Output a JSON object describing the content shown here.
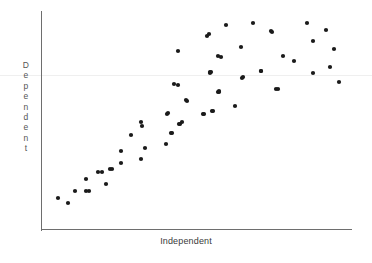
{
  "chart_data": {
    "type": "scatter",
    "title": "",
    "subtitle": "",
    "xlabel": "Independent",
    "ylabel": "Dependent",
    "ylabel_letters": [
      "D",
      "e",
      "p",
      "e",
      "n",
      "d",
      "e",
      "n",
      "t"
    ],
    "xlabel_tick_labels": [],
    "ylabel_tick_labels": [],
    "grid": false,
    "legend": null,
    "legend_position": "none",
    "marker": "filled-circle",
    "marker_color": "#1a1a1a",
    "marker_radius_px": 2.1,
    "axis_color": "#6e6e6e",
    "background_color": "#ffffff",
    "annotations": [],
    "xlim": [
      0,
      1
    ],
    "ylim": [
      0,
      1
    ],
    "axes_pixel_box": {
      "left": 41,
      "right": 352,
      "top": 11,
      "bottom": 230
    },
    "artifact_line_y_px": 75,
    "points": [
      [
        58,
        198
      ],
      [
        68,
        203
      ],
      [
        75,
        191
      ],
      [
        86,
        179
      ],
      [
        86,
        191
      ],
      [
        98,
        172
      ],
      [
        110,
        169
      ],
      [
        106,
        184
      ],
      [
        89,
        191
      ],
      [
        102,
        172
      ],
      [
        112,
        169
      ],
      [
        121,
        151
      ],
      [
        121,
        163
      ],
      [
        131,
        135
      ],
      [
        141,
        159
      ],
      [
        142,
        126
      ],
      [
        145,
        148
      ],
      [
        141,
        122
      ],
      [
        166,
        144
      ],
      [
        167,
        114
      ],
      [
        168,
        113
      ],
      [
        171,
        133
      ],
      [
        172,
        133
      ],
      [
        174,
        84
      ],
      [
        178,
        85
      ],
      [
        178,
        51
      ],
      [
        179,
        124
      ],
      [
        180,
        124
      ],
      [
        182,
        122
      ],
      [
        186,
        100
      ],
      [
        187,
        101
      ],
      [
        203,
        114
      ],
      [
        204,
        114
      ],
      [
        207,
        36
      ],
      [
        209,
        34
      ],
      [
        210,
        73
      ],
      [
        210,
        72
      ],
      [
        211,
        72
      ],
      [
        212,
        111
      ],
      [
        213,
        111
      ],
      [
        218,
        56
      ],
      [
        218,
        92
      ],
      [
        219,
        92
      ],
      [
        219,
        91
      ],
      [
        221,
        57
      ],
      [
        226,
        25
      ],
      [
        235,
        106
      ],
      [
        241,
        47
      ],
      [
        242,
        78
      ],
      [
        243,
        77
      ],
      [
        253,
        23
      ],
      [
        261,
        71
      ],
      [
        261,
        71
      ],
      [
        271,
        31
      ],
      [
        272,
        32
      ],
      [
        276,
        89
      ],
      [
        278,
        89
      ],
      [
        283,
        56
      ],
      [
        294,
        61
      ],
      [
        307,
        23
      ],
      [
        313,
        41
      ],
      [
        313,
        73
      ],
      [
        326,
        30
      ],
      [
        330,
        67
      ],
      [
        334,
        49
      ],
      [
        339,
        82
      ]
    ]
  }
}
